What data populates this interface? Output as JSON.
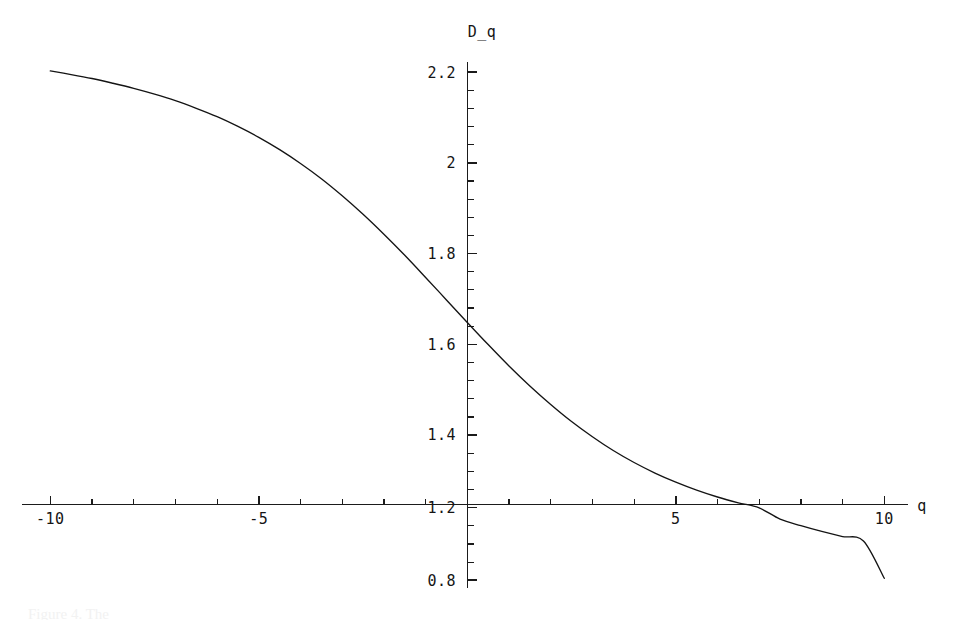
{
  "figure": {
    "background_color": "#ffffff",
    "curve_color": "#141414",
    "axis_color": "#1b1b1b",
    "caption_fragment": "Figure 4.  The"
  },
  "labels": {
    "y_axis_label": "D_q",
    "x_axis_label": "q"
  },
  "ticks": {
    "y": [
      "2.2",
      "2",
      "1.8",
      "1.6",
      "1.4",
      "1.2",
      "0.8"
    ],
    "x": [
      "-10",
      "-5",
      "5",
      "10"
    ]
  },
  "chart_data": {
    "type": "line",
    "title": "",
    "subtitle": "",
    "xlabel": "q",
    "ylabel": "D_q",
    "xlim": [
      -10,
      10
    ],
    "ylim": [
      0.8,
      2.2
    ],
    "grid": false,
    "legend": null,
    "x_ticks": [
      -10,
      -5,
      5,
      10
    ],
    "x_tick_labels": [
      "-10",
      "-5",
      "5",
      "10"
    ],
    "x_minor_tick_step": 1,
    "y_ticks": [
      0.8,
      1.2,
      1.4,
      1.6,
      1.8,
      2.0,
      2.2
    ],
    "y_tick_labels": [
      "0.8",
      "1.2",
      "1.4",
      "1.6",
      "1.8",
      "2",
      "2.2"
    ],
    "y_minor_tick_step": 0.05,
    "x_axis_crosses_y_at": 1.0,
    "y_axis_crosses_x_at": 0,
    "series": [
      {
        "name": "D_q",
        "x": [
          -10,
          -9.5,
          -9,
          -8.5,
          -8,
          -7.5,
          -7,
          -6.5,
          -6,
          -5.5,
          -5,
          -4.5,
          -4,
          -3.5,
          -3,
          -2.5,
          -2,
          -1.5,
          -1,
          -0.5,
          0,
          0.5,
          1,
          1.5,
          2,
          2.5,
          3,
          3.5,
          4,
          4.5,
          5,
          5.5,
          6,
          6.5,
          7,
          7.5,
          8,
          8.5,
          9,
          9.5,
          10
        ],
        "y": [
          2.203,
          2.193,
          2.182,
          2.169,
          2.155,
          2.139,
          2.121,
          2.1,
          2.077,
          2.05,
          2.02,
          1.986,
          1.948,
          1.906,
          1.859,
          1.808,
          1.753,
          1.695,
          1.634,
          1.572,
          1.51,
          1.449,
          1.39,
          1.335,
          1.284,
          1.237,
          1.195,
          1.157,
          1.124,
          1.095,
          1.07,
          1.048,
          1.029,
          1.013,
          0.999,
          0.968,
          0.95,
          0.934,
          0.92,
          0.908,
          0.805
        ]
      }
    ]
  }
}
